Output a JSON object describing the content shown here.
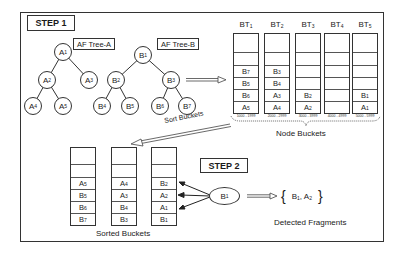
{
  "step1": {
    "label": "STEP 1"
  },
  "step2": {
    "label": "STEP 2"
  },
  "tree_a": {
    "label": "AF Tree-A",
    "nodes": [
      {
        "base": "A",
        "sub": "1"
      },
      {
        "base": "A",
        "sub": "2"
      },
      {
        "base": "A",
        "sub": "3"
      },
      {
        "base": "A",
        "sub": "4"
      },
      {
        "base": "A",
        "sub": "5"
      }
    ]
  },
  "tree_b": {
    "label": "AF Tree-B",
    "nodes": [
      {
        "base": "B",
        "sub": "1"
      },
      {
        "base": "B",
        "sub": "2"
      },
      {
        "base": "B",
        "sub": "3"
      },
      {
        "base": "B",
        "sub": "4"
      },
      {
        "base": "B",
        "sub": "5"
      },
      {
        "base": "B",
        "sub": "6"
      },
      {
        "base": "B",
        "sub": "7"
      }
    ]
  },
  "node_buckets": {
    "caption": "Node Buckets",
    "columns": [
      {
        "title": "BT",
        "title_sub": "1",
        "range": "1000 - 1999",
        "cells": [
          [
            "",
            ""
          ],
          [
            "",
            ""
          ],
          [
            "B",
            "7"
          ],
          [
            "B",
            "5"
          ],
          [
            "B",
            "6"
          ],
          [
            "A",
            "5"
          ]
        ]
      },
      {
        "title": "BT",
        "title_sub": "2",
        "range": "2000 - 2999",
        "cells": [
          [
            "",
            ""
          ],
          [
            "",
            ""
          ],
          [
            "B",
            "3"
          ],
          [
            "B",
            "4"
          ],
          [
            "A",
            "3"
          ],
          [
            "A",
            "4"
          ]
        ]
      },
      {
        "title": "BT",
        "title_sub": "3",
        "range": "3000 - 3999",
        "cells": [
          [
            "",
            ""
          ],
          [
            "",
            ""
          ],
          [
            "",
            ""
          ],
          [
            "",
            ""
          ],
          [
            "B",
            "2"
          ],
          [
            "A",
            "2"
          ]
        ]
      },
      {
        "title": "BT",
        "title_sub": "4",
        "range": "4000 - 4999",
        "cells": [
          [
            "",
            ""
          ],
          [
            "",
            ""
          ],
          [
            "",
            ""
          ],
          [
            "",
            ""
          ],
          [
            "",
            ""
          ],
          [
            "",
            ""
          ]
        ]
      },
      {
        "title": "BT",
        "title_sub": "5",
        "range": "5000 - 5999",
        "cells": [
          [
            "",
            ""
          ],
          [
            "",
            ""
          ],
          [
            "",
            ""
          ],
          [
            "",
            ""
          ],
          [
            "B",
            "1"
          ],
          [
            "A",
            "1"
          ]
        ]
      }
    ]
  },
  "sort_arrow": {
    "label": "Sort Buckets"
  },
  "sorted_buckets": {
    "caption": "Sorted Buckets",
    "columns": [
      {
        "cells": [
          [
            "",
            ""
          ],
          [
            "",
            ""
          ],
          [
            "A",
            "5"
          ],
          [
            "B",
            "5"
          ],
          [
            "B",
            "6"
          ],
          [
            "B",
            "7"
          ]
        ]
      },
      {
        "cells": [
          [
            "",
            ""
          ],
          [
            "",
            ""
          ],
          [
            "A",
            "4"
          ],
          [
            "A",
            "3"
          ],
          [
            "B",
            "4"
          ],
          [
            "B",
            "3"
          ]
        ]
      },
      {
        "cells": [
          [
            "",
            ""
          ],
          [
            "",
            ""
          ],
          [
            "B",
            "2"
          ],
          [
            "A",
            "2"
          ],
          [
            "A",
            "1"
          ],
          [
            "B",
            "1"
          ]
        ]
      }
    ]
  },
  "query_node": {
    "base": "B",
    "sub": "1"
  },
  "detected": {
    "caption": "Detected Fragments",
    "items": [
      {
        "base": "B",
        "sub": "1"
      },
      {
        "base": "A",
        "sub": "2"
      }
    ],
    "separator": ","
  }
}
